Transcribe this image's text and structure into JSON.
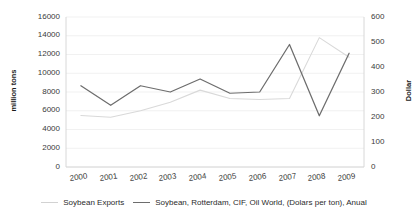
{
  "chart_data": {
    "type": "line",
    "title": "",
    "x": [
      2000,
      2001,
      2002,
      2003,
      2004,
      2005,
      2006,
      2007,
      2008,
      2009
    ],
    "categories": [
      "2000",
      "2001",
      "2002",
      "2003",
      "2004",
      "2005",
      "2006",
      "2007",
      "2008",
      "2009"
    ],
    "series": [
      {
        "name": "Soybean Exports",
        "axis": "left",
        "unit": "million tons",
        "color": "#d9d9d9",
        "values": [
          5500,
          5300,
          6000,
          6900,
          8200,
          7300,
          7200,
          7300,
          13800,
          11700
        ]
      },
      {
        "name": "Soybean, Rotterdam, CIF, Oil World, (Dolars per ton), Anual",
        "axis": "right",
        "unit": "Dollar",
        "color": "#6d6d6d",
        "values": [
          325,
          247,
          325,
          300,
          352,
          295,
          300,
          490,
          205,
          455
        ]
      }
    ],
    "xlabel": "",
    "ylabel_left": "million tons",
    "ylabel_right": "Dollar",
    "ylim_left": [
      0,
      16000
    ],
    "ylim_right": [
      0,
      600
    ],
    "yticks_left": [
      "16000",
      "14000",
      "12000",
      "10000",
      "8000",
      "6000",
      "4000",
      "2000",
      "0"
    ],
    "yticks_right": [
      "600",
      "500",
      "400",
      "300",
      "200",
      "100",
      "0"
    ],
    "grid": true,
    "legend_position": "bottom"
  },
  "legend": {
    "items": [
      {
        "label": "Soybean Exports"
      },
      {
        "label": "Soybean, Rotterdam, CIF, Oil World, (Dolars per ton), Anual"
      }
    ]
  }
}
